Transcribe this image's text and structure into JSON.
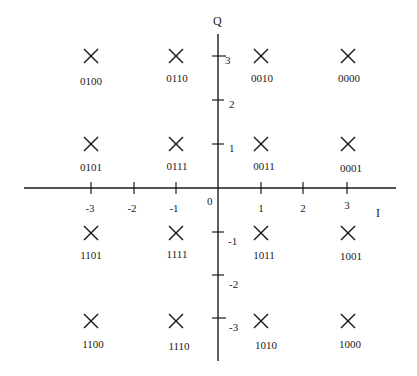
{
  "diagram": {
    "type": "constellation",
    "axes": {
      "horizontal_label": "I",
      "vertical_label": "Q",
      "origin_label": "0",
      "i_ticks": [
        "-3",
        "-2",
        "-1",
        "1",
        "2",
        "3"
      ],
      "q_ticks": [
        "3",
        "2",
        "1",
        "-1",
        "-2",
        "-3"
      ]
    },
    "points": [
      {
        "i": -3,
        "q": 3,
        "code": "0100"
      },
      {
        "i": -1,
        "q": 3,
        "code": "0110"
      },
      {
        "i": 1,
        "q": 3,
        "code": "0010"
      },
      {
        "i": 3,
        "q": 3,
        "code": "0000"
      },
      {
        "i": -3,
        "q": 1,
        "code": "0101"
      },
      {
        "i": -1,
        "q": 1,
        "code": "0111"
      },
      {
        "i": 1,
        "q": 1,
        "code": "0011"
      },
      {
        "i": 3,
        "q": 1,
        "code": "0001"
      },
      {
        "i": -3,
        "q": -1,
        "code": "1101"
      },
      {
        "i": -1,
        "q": -1,
        "code": "1111"
      },
      {
        "i": 1,
        "q": -1,
        "code": "1011"
      },
      {
        "i": 3,
        "q": -1,
        "code": "1001"
      },
      {
        "i": -3,
        "q": -3,
        "code": "1100"
      },
      {
        "i": -1,
        "q": -3,
        "code": "1110"
      },
      {
        "i": 1,
        "q": -3,
        "code": "1010"
      },
      {
        "i": 3,
        "q": -3,
        "code": "1000"
      }
    ],
    "colors": {
      "ink": "#1a1a1a",
      "background": "#ffffff"
    }
  }
}
